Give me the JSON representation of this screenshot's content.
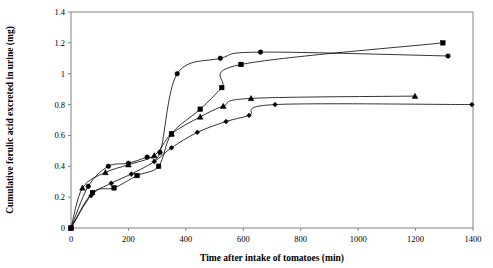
{
  "chart_data": {
    "type": "line",
    "title": "",
    "xlabel": "Time after intake of tomatoes (min)",
    "ylabel": "Cumulative ferulic acid excreted in urine (mg)",
    "xlim": [
      0,
      1400
    ],
    "ylim": [
      0,
      1.4
    ],
    "xticks": [
      0,
      200,
      400,
      600,
      800,
      1000,
      1200,
      1400
    ],
    "yticks": [
      0,
      0.2,
      0.4,
      0.6,
      0.8,
      1,
      1.2,
      1.4
    ],
    "xtick_labels": [
      "0",
      "200",
      "400",
      "600",
      "800",
      "1000",
      "1200",
      "1400"
    ],
    "ytick_labels": [
      "0",
      "0.2",
      "0.4",
      "0.6",
      "0.8",
      "1",
      "1.2",
      "1.4"
    ],
    "grid": false,
    "legend": "none",
    "series": [
      {
        "name": "Subject 1",
        "marker": "circle",
        "color": "#000000",
        "points": [
          [
            0,
            0.0
          ],
          [
            60,
            0.27
          ],
          [
            130,
            0.4
          ],
          [
            200,
            0.42
          ],
          [
            265,
            0.46
          ],
          [
            310,
            0.49
          ],
          [
            370,
            1.0
          ],
          [
            520,
            1.1
          ],
          [
            660,
            1.14
          ],
          [
            1313,
            1.115
          ]
        ]
      },
      {
        "name": "Subject 2",
        "marker": "square",
        "color": "#000000",
        "points": [
          [
            0,
            0.0
          ],
          [
            75,
            0.23
          ],
          [
            150,
            0.26
          ],
          [
            230,
            0.34
          ],
          [
            305,
            0.4
          ],
          [
            350,
            0.61
          ],
          [
            450,
            0.77
          ],
          [
            525,
            0.91
          ],
          [
            592,
            1.06
          ],
          [
            1295,
            1.2
          ]
        ]
      },
      {
        "name": "Subject 3",
        "marker": "triangle",
        "color": "#000000",
        "points": [
          [
            0,
            0.0
          ],
          [
            40,
            0.26
          ],
          [
            120,
            0.36
          ],
          [
            200,
            0.41
          ],
          [
            290,
            0.47
          ],
          [
            350,
            0.61
          ],
          [
            450,
            0.72
          ],
          [
            530,
            0.79
          ],
          [
            627,
            0.84
          ],
          [
            1198,
            0.855
          ]
        ]
      },
      {
        "name": "Subject 4",
        "marker": "diamond",
        "color": "#000000",
        "points": [
          [
            0,
            0.0
          ],
          [
            70,
            0.21
          ],
          [
            140,
            0.29
          ],
          [
            210,
            0.35
          ],
          [
            290,
            0.43
          ],
          [
            350,
            0.52
          ],
          [
            440,
            0.62
          ],
          [
            540,
            0.69
          ],
          [
            620,
            0.73
          ],
          [
            711,
            0.8
          ],
          [
            1396,
            0.8
          ]
        ]
      }
    ]
  },
  "axes": {
    "x_title": "Time after intake of tomatoes (min)",
    "y_title": "Cumulative ferulic acid excreted in urine (mg)"
  }
}
